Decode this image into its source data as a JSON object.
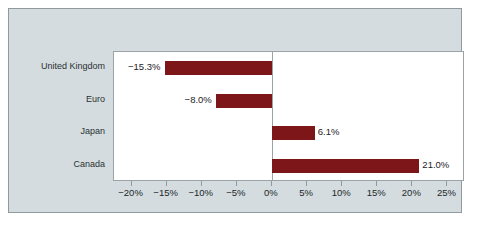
{
  "chart_data": {
    "type": "bar",
    "orientation": "horizontal",
    "title": "",
    "subtitle": "",
    "xlabel": "",
    "ylabel": "",
    "categories": [
      "United Kingdom",
      "Euro",
      "Japan",
      "Canada"
    ],
    "values": [
      -15.3,
      -8.0,
      6.1,
      21.0
    ],
    "data_labels": [
      "−15.3%",
      "−8.0%",
      "6.1%",
      "21.0%"
    ],
    "series": [
      {
        "name": "",
        "values": [
          -15.3,
          -8.0,
          6.1,
          21.0
        ]
      }
    ],
    "xlim": [
      -22.5,
      27.5
    ],
    "xticks": [
      -20,
      -15,
      -10,
      -5,
      0,
      5,
      10,
      15,
      20,
      25
    ],
    "xtick_labels": [
      "−20%",
      "−15%",
      "−10%",
      "−5%",
      "0%",
      "5%",
      "10%",
      "15%",
      "20%",
      "25%"
    ],
    "grid": false,
    "legend": false,
    "legend_position": "none",
    "bar_color": "#7c1619",
    "plot_background": "#ffffff",
    "figure_background": "#d4dcdf",
    "axis_color": "#9aa4a8",
    "zero_reference_line": 0
  },
  "figure": {
    "background_color": "#ffffff",
    "panel_color": "#d4dcdf",
    "border_color": "#8e9a9e"
  }
}
